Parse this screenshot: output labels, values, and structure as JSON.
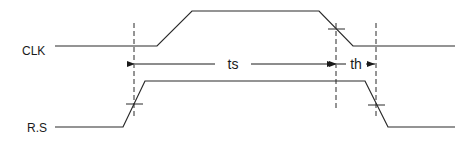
{
  "diagram": {
    "type": "timing-diagram",
    "signals": [
      {
        "name": "CLK",
        "label": "CLK"
      },
      {
        "name": "R.S",
        "label": "R.S"
      }
    ],
    "intervals": [
      {
        "name": "setup-time",
        "label": "ts"
      },
      {
        "name": "hold-time",
        "label": "th"
      }
    ],
    "colors": {
      "line": "#2a2a2a",
      "background": "#ffffff"
    }
  }
}
